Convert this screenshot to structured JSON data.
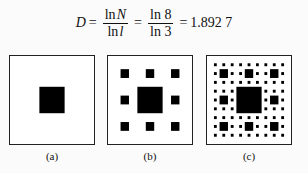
{
  "formula": {
    "lhs": "D",
    "eq1": "=",
    "frac1": {
      "num_fn": "ln",
      "num_var": "N",
      "den_fn": "ln",
      "den_var": "l"
    },
    "eq2": "=",
    "frac2": {
      "num": "ln 8",
      "den": "ln 3"
    },
    "eq3": "=",
    "result": "1.892 7"
  },
  "panels": [
    {
      "id": "a",
      "label": "(a)",
      "level": 1
    },
    {
      "id": "b",
      "label": "(b)",
      "level": 2
    },
    {
      "id": "c",
      "label": "(c)",
      "level": 3
    }
  ],
  "colors": {
    "fill": "#000000",
    "background": "#ffffff",
    "border": "#222222"
  }
}
